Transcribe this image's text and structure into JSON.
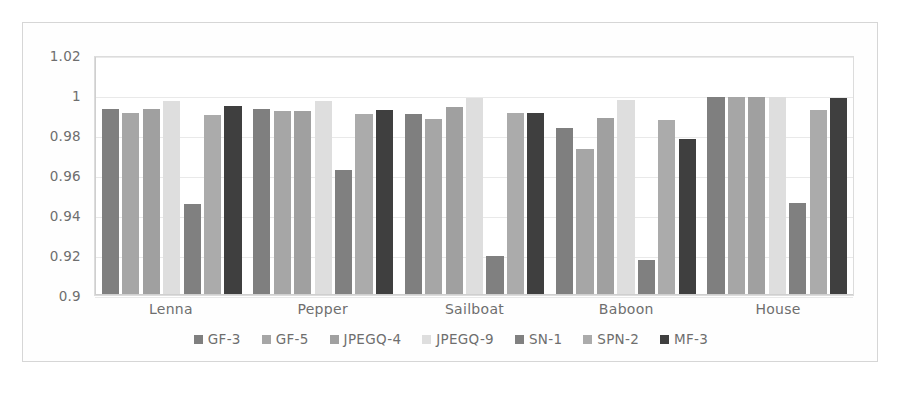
{
  "chart_data": {
    "type": "bar",
    "title": "",
    "subtitle": "",
    "xlabel": "",
    "ylabel": "",
    "ylim": [
      0.9,
      1.02
    ],
    "yticks": [
      "1.02",
      "1",
      "0.98",
      "0.96",
      "0.94",
      "0.92",
      "0.9"
    ],
    "ytick_values": [
      1.02,
      1.0,
      0.98,
      0.96,
      0.94,
      0.92,
      0.9
    ],
    "grid": true,
    "legend_position": "bottom",
    "categories": [
      "Lenna",
      "Pepper",
      "Sailboat",
      "Baboon",
      "House"
    ],
    "series": [
      {
        "name": "GF-3",
        "color": "#7f7f7f",
        "values": [
          0.9935,
          0.9935,
          0.991,
          0.9843,
          0.9998
        ]
      },
      {
        "name": "GF-5",
        "color": "#a6a6a6",
        "values": [
          0.9918,
          0.9927,
          0.9884,
          0.9735,
          0.9998
        ]
      },
      {
        "name": "JPEGQ-4",
        "color": "#a0a0a0",
        "values": [
          0.9938,
          0.9927,
          0.9948,
          0.9893,
          0.9997
        ]
      },
      {
        "name": "JPEGQ-9",
        "color": "#dedede",
        "values": [
          0.9975,
          0.9979,
          0.9993,
          0.998,
          0.9998
        ]
      },
      {
        "name": "SN-1",
        "color": "#808080",
        "values": [
          0.9458,
          0.9628,
          0.919,
          0.9171,
          0.946
        ]
      },
      {
        "name": "SPN-2",
        "color": "#ababab",
        "values": [
          0.9908,
          0.9911,
          0.9918,
          0.9879,
          0.9932
        ]
      },
      {
        "name": "MF-3",
        "color": "#3f3f3f",
        "values": [
          0.995,
          0.9933,
          0.9918,
          0.9787,
          0.999
        ]
      }
    ]
  }
}
